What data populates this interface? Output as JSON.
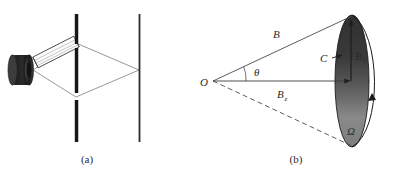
{
  "figure": {
    "panels": [
      {
        "id": "panel-a",
        "caption": "(a)",
        "description": "double-slit interference optical setup",
        "components": [
          {
            "name": "light-source-cylinder",
            "shape": "dark cylinder"
          },
          {
            "name": "collimator-tube",
            "shape": "angled hatched rectangle"
          },
          {
            "name": "slit-barrier",
            "shape": "three vertical bars with two gaps"
          },
          {
            "name": "observation-screen",
            "shape": "single vertical line"
          },
          {
            "name": "ray-paths",
            "shape": "two crossing beam lines"
          }
        ]
      },
      {
        "id": "panel-b",
        "caption": "(b)",
        "description": "magnetic field vector decomposition on a spherical cap subtending solid angle",
        "labels": {
          "origin": "O",
          "field_vector": "B",
          "angle": "θ",
          "cap_point": "C",
          "perp_component": "B",
          "perp_component_sub": "1",
          "axial_component": "B",
          "axial_component_sub": "z",
          "solid_angle": "Ω"
        },
        "components": [
          {
            "name": "cone-upper-edge",
            "shape": "solid line from O to cap top"
          },
          {
            "name": "cone-lower-edge",
            "shape": "dashed line from O to cap bottom"
          },
          {
            "name": "axis-line",
            "shape": "horizontal arrow from O to cap center"
          },
          {
            "name": "spherical-cap",
            "shape": "shaded ellipse"
          },
          {
            "name": "cap-outline-arc",
            "shape": "curved arc right of ellipse"
          },
          {
            "name": "b1-arrow",
            "shape": "vertical arrow up at cap center"
          }
        ]
      }
    ]
  },
  "colors": {
    "ink": "#2b2b2b",
    "line": "#555555",
    "bar_dark": "#1a1a1a",
    "bar_edge": "#888888",
    "cap_dark": "#3a3a3a",
    "cap_light": "#8a8a8a",
    "source_dark": "#262626",
    "background": "#ffffff"
  }
}
